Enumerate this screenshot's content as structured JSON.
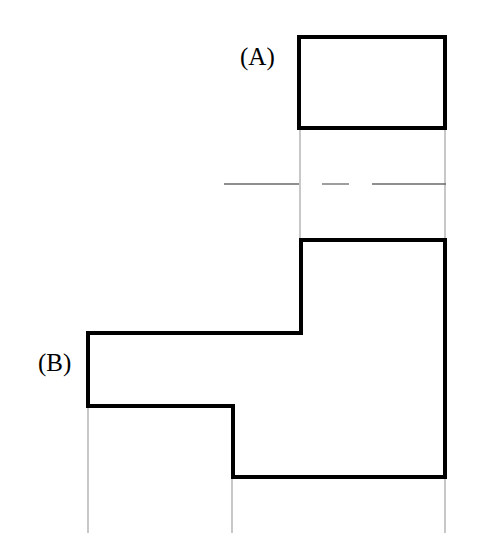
{
  "figure": {
    "type": "engineering-drawing",
    "width": 482,
    "height": 559,
    "background_color": "#ffffff",
    "stroke_color": "#000000",
    "thick_stroke_width": 4,
    "thin_stroke_width": 1,
    "thin_stroke_color": "#9a9a9a"
  },
  "labels": [
    {
      "id": "label-a",
      "text": "(A)",
      "x": 240,
      "y": 44,
      "font_size": 25,
      "refers_to": "upper-rectangle-view"
    },
    {
      "id": "label-b",
      "text": "(B)",
      "x": 38,
      "y": 350,
      "font_size": 25,
      "refers_to": "lower-stepped-profile-view"
    }
  ],
  "shapes": {
    "view_a": {
      "name": "upper-rectangle",
      "kind": "rectangle",
      "x": 299,
      "y": 37,
      "width": 146,
      "height": 91,
      "stroke_width": 4,
      "fill": "none"
    },
    "view_b": {
      "name": "lower-stepped-profile",
      "kind": "polygon",
      "stroke_width": 4,
      "fill": "none",
      "points": [
        [
          301,
          240
        ],
        [
          445,
          240
        ],
        [
          445,
          477
        ],
        [
          233,
          477
        ],
        [
          233,
          406
        ],
        [
          88,
          406
        ],
        [
          88,
          333
        ],
        [
          301,
          333
        ]
      ]
    }
  },
  "centerline": {
    "name": "horizontal-centerline",
    "y": 184,
    "x_start": 224,
    "x_end": 445,
    "pattern": "dash-dot-dash",
    "stroke_width": 1,
    "color": "#6a6a6a",
    "segments": [
      {
        "x1": 224,
        "x2": 299
      },
      {
        "x1": 322,
        "x2": 349
      },
      {
        "x1": 372,
        "x2": 446
      }
    ]
  },
  "projection_lines": [
    {
      "name": "projection-left-between-views",
      "x": 300,
      "y1": 128,
      "y2": 241
    },
    {
      "name": "projection-right-between-views",
      "x": 445,
      "y1": 128,
      "y2": 241
    },
    {
      "name": "extension-below-left",
      "x": 88,
      "y1": 406,
      "y2": 533
    },
    {
      "name": "extension-below-middle",
      "x": 232,
      "y1": 477,
      "y2": 533
    },
    {
      "name": "extension-below-right",
      "x": 445,
      "y1": 477,
      "y2": 533
    }
  ]
}
